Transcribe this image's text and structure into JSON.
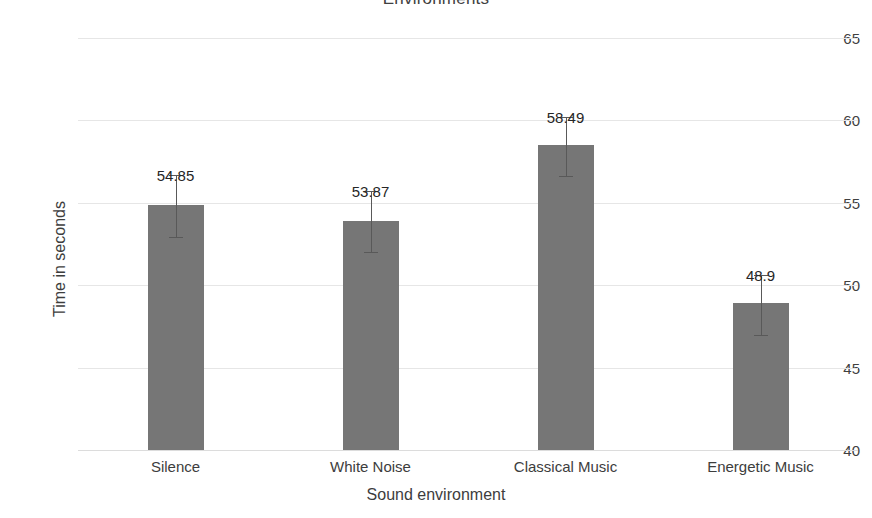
{
  "chart_data": {
    "type": "bar",
    "title": "Environments",
    "xlabel": "Sound environment",
    "ylabel": "Time in seconds",
    "categories": [
      "Silence",
      "White Noise",
      "Classical Music",
      "Energetic Music"
    ],
    "values": [
      54.85,
      53.87,
      58.49,
      48.9
    ],
    "value_labels": [
      "54.85",
      "53.87",
      "58.49",
      "48.9"
    ],
    "error_low": [
      52.9,
      52.0,
      56.6,
      47.0
    ],
    "error_high": [
      56.7,
      55.7,
      60.2,
      50.6
    ],
    "ylim": [
      40,
      65
    ],
    "yticks": [
      40,
      45,
      50,
      55,
      60,
      65
    ],
    "ytick_labels": [
      "40",
      "45",
      "50",
      "55",
      "60",
      "65"
    ],
    "grid": true,
    "legend": false,
    "legend_position": "none",
    "bar_color": "#767676",
    "gridline_color": "#e6e6e6",
    "error_bar_color": "#595959",
    "text_color": "#3d3d3d",
    "background_color": "#ffffff"
  }
}
